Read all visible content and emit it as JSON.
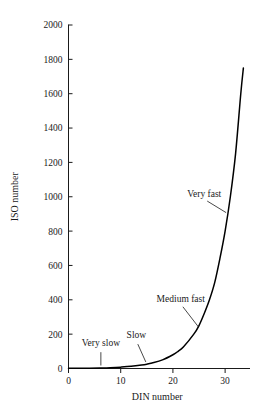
{
  "chart_data": {
    "type": "line",
    "title": "",
    "xlabel": "DIN number",
    "ylabel": "ISO number",
    "xlim": [
      0,
      34
    ],
    "ylim": [
      0,
      2000
    ],
    "grid": false,
    "legend": "none",
    "x_ticks": [
      0,
      10,
      20,
      30
    ],
    "x_tick_labels": [
      "0",
      "10",
      "20",
      "30"
    ],
    "y_ticks": [
      0,
      200,
      400,
      600,
      800,
      1000,
      1200,
      1400,
      1600,
      1800,
      2000
    ],
    "y_tick_labels": [
      "0",
      "200",
      "400",
      "600",
      "800",
      "1000",
      "1200",
      "1400",
      "1600",
      "1800",
      "2000"
    ],
    "series": [
      {
        "name": "DIN to ISO conversion",
        "color": "#000000",
        "x": [
          0,
          2,
          4,
          6,
          8,
          10,
          12,
          14,
          15,
          16,
          18,
          20,
          21,
          22,
          24,
          25,
          26,
          27,
          28,
          29,
          30,
          31,
          32,
          33,
          33.5
        ],
        "y": [
          0.8,
          1.25,
          2,
          3.2,
          5,
          8,
          12.5,
          20,
          25,
          32,
          50,
          80,
          100,
          125,
          200,
          250,
          320,
          400,
          500,
          640,
          800,
          1000,
          1250,
          1600,
          1750
        ]
      }
    ],
    "annotations": [
      {
        "text": "Very slow",
        "label_x": 6.2,
        "label_y": 130,
        "point_x": 6.2,
        "point_y": 3
      },
      {
        "text": "Slow",
        "label_x": 13.0,
        "label_y": 175,
        "point_x": 15.0,
        "point_y": 25
      },
      {
        "text": "Medium fast",
        "label_x": 21.5,
        "label_y": 390,
        "point_x": 25.2,
        "point_y": 230
      },
      {
        "text": "Very fast",
        "label_x": 26.0,
        "label_y": 1000,
        "point_x": 30.6,
        "point_y": 900
      }
    ]
  }
}
